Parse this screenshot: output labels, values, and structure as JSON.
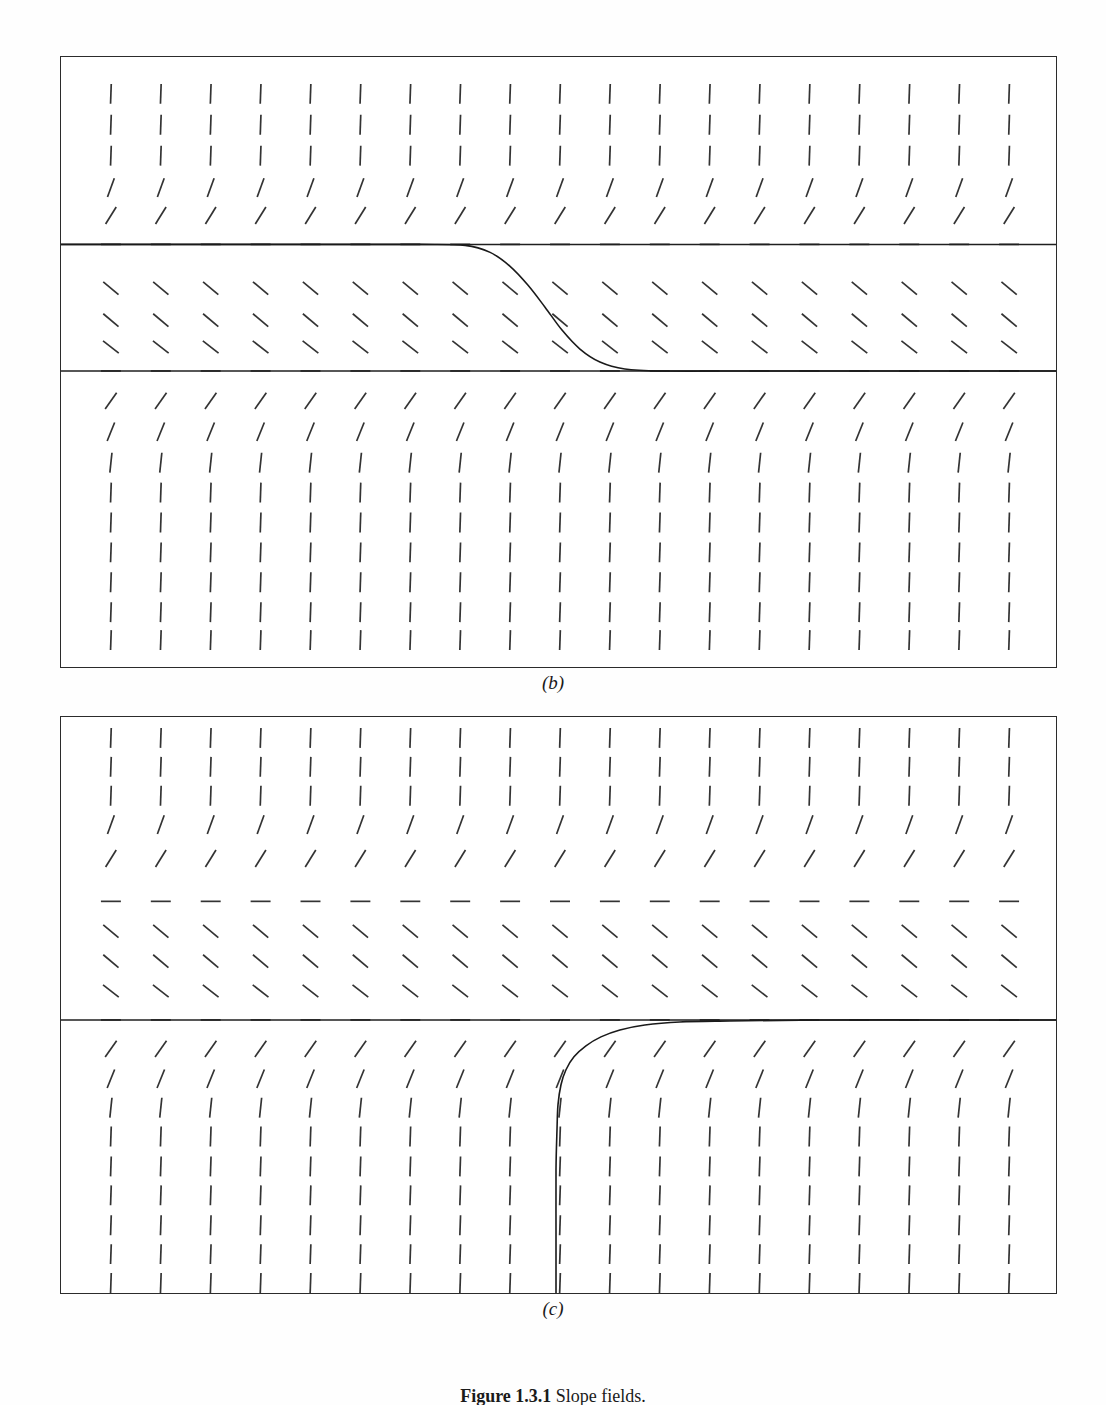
{
  "figure": {
    "caption_number": "Figure 1.3.1",
    "caption_text": "Slope fields.",
    "panels": [
      {
        "id": "b",
        "label": "(b)"
      },
      {
        "id": "c",
        "label": "(c)"
      }
    ]
  },
  "chart_data": {
    "type": "line",
    "xlabel": "",
    "ylabel": "",
    "grid": false,
    "legend": null,
    "panels": [
      {
        "id": "b",
        "label": "(b)",
        "frame": {
          "x": 60,
          "y": 56,
          "width": 997,
          "height": 612
        },
        "slope_field": {
          "columns": 19,
          "col_start_px": 110,
          "col_step_px": 50,
          "rows_px": [
            93,
            124,
            155,
            187,
            215,
            244,
            288,
            320,
            347,
            371,
            401,
            432,
            463,
            493,
            523,
            553,
            583,
            613,
            641
          ],
          "row_angles_deg": [
            88,
            88,
            88,
            70,
            58,
            0,
            -40,
            -40,
            -38,
            0,
            55,
            68,
            84,
            88,
            88,
            88,
            88,
            88,
            88
          ],
          "tick_length_px": 20,
          "equilibrium_rows_px": [
            244,
            371
          ]
        },
        "equilibrium_lines": [
          {
            "y_px": 244,
            "drawn_solid": true,
            "note": "upper equilibrium, solid from left edge"
          },
          {
            "y_px": 371,
            "drawn_solid": true,
            "note": "lower equilibrium, solid to right edge"
          }
        ],
        "solution_curve": {
          "description": "sigmoid descending from upper equilibrium to lower equilibrium",
          "points_px": [
            [
              60,
              244
            ],
            [
              200,
              244
            ],
            [
              320,
              244
            ],
            [
              420,
              244
            ],
            [
              465,
              245
            ],
            [
              490,
              252
            ],
            [
              510,
              266
            ],
            [
              528,
              285
            ],
            [
              545,
              307
            ],
            [
              562,
              330
            ],
            [
              580,
              349
            ],
            [
              600,
              362
            ],
            [
              625,
              369
            ],
            [
              660,
              371
            ],
            [
              760,
              371
            ],
            [
              900,
              371
            ],
            [
              1057,
              371
            ]
          ]
        }
      },
      {
        "id": "c",
        "label": "(c)",
        "frame": {
          "x": 60,
          "y": 716,
          "width": 997,
          "height": 578
        },
        "slope_field": {
          "columns": 19,
          "col_start_px": 110,
          "col_step_px": 50,
          "rows_px": [
            737,
            766,
            795,
            824,
            858,
            901,
            931,
            961,
            991,
            1020,
            1049,
            1079,
            1108,
            1137,
            1167,
            1196,
            1226,
            1255,
            1284
          ],
          "row_angles_deg": [
            88,
            88,
            88,
            70,
            58,
            0,
            -40,
            -40,
            -38,
            0,
            55,
            68,
            84,
            88,
            88,
            88,
            88,
            88,
            88
          ],
          "tick_length_px": 20,
          "equilibrium_rows_px": [
            901,
            1020
          ]
        },
        "equilibrium_lines": [
          {
            "y_px": 901,
            "drawn_solid": false,
            "note": "upper equilibrium, only dashes"
          },
          {
            "y_px": 1020,
            "drawn_solid": true,
            "note": "lower equilibrium, solid to right edge"
          }
        ],
        "solution_curve": {
          "description": "curve rising steeply from bottom border, asymptotic to lower equilibrium from below",
          "points_px": [
            [
              556,
              1294
            ],
            [
              556,
              1230
            ],
            [
              556,
              1170
            ],
            [
              557,
              1130
            ],
            [
              558,
              1105
            ],
            [
              561,
              1085
            ],
            [
              566,
              1070
            ],
            [
              574,
              1057
            ],
            [
              586,
              1046
            ],
            [
              601,
              1037
            ],
            [
              620,
              1030
            ],
            [
              645,
              1025
            ],
            [
              680,
              1022
            ],
            [
              730,
              1021
            ],
            [
              820,
              1020
            ],
            [
              940,
              1020
            ],
            [
              1057,
              1020
            ]
          ]
        }
      }
    ]
  }
}
